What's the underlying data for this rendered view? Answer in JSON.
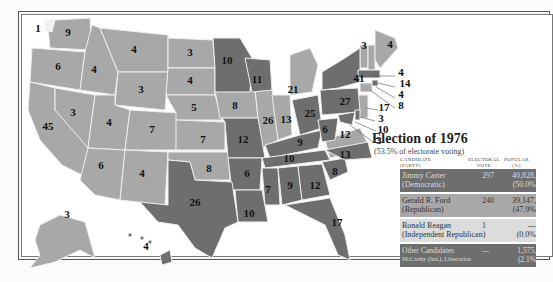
{
  "legend": {
    "title": "Election of 1976",
    "subtitle": "(53.5% of electorate voting)",
    "headers": {
      "candidate": "CANDIDATE",
      "party": "(PARTY)",
      "electoral_1": "ELECTORAL",
      "electoral_2": "VOTE",
      "popular_1": "POPULAR",
      "popular_2": "(%)"
    },
    "rows": [
      {
        "name": "Jimmy Carter",
        "party": "(Democratic)",
        "electoral": "297",
        "popular": "40,828,",
        "pct": "(50.0%"
      },
      {
        "name": "Gerald R. Ford",
        "party": "(Republican)",
        "electoral": "240",
        "popular": "39,147,",
        "pct": "(47.9%"
      },
      {
        "name": "Ronald Reagan",
        "party": "(Independent Republican)",
        "electoral": "1",
        "popular": "—",
        "pct": "(0.0%"
      },
      {
        "name": "Other Candidates",
        "party": "McCarthy (Ind.), Libertarian",
        "electoral": "—",
        "popular": "1,575,",
        "pct": "(2.1%"
      }
    ]
  },
  "colors": {
    "democratic": "#6e6e6e",
    "republican": "#a8a8a8",
    "independent": "#dcdcdc"
  },
  "states": {
    "WA_reagan": "1",
    "WA": "9",
    "OR": "6",
    "CA": "45",
    "ID": "4",
    "MT": "4",
    "NV": "3",
    "WY": "3",
    "UT": "4",
    "AZ": "6",
    "CO": "7",
    "NM": "4",
    "ND": "3",
    "SD": "4",
    "NE": "5",
    "KS": "7",
    "OK": "8",
    "TX": "26",
    "MN": "10",
    "IA": "8",
    "MO": "12",
    "AR": "6",
    "LA": "10",
    "WI": "11",
    "IL": "26",
    "MI": "21",
    "IN": "13",
    "OH": "25",
    "KY": "9",
    "TN": "10",
    "MS": "7",
    "AL": "9",
    "GA": "12",
    "FL": "17",
    "SC": "8",
    "NC": "13",
    "VA": "12",
    "WV": "6",
    "PA": "27",
    "NY": "41",
    "VT": "3",
    "ME": "4",
    "NH": "4",
    "MA": "14",
    "RI": "4",
    "CT": "8",
    "NJ": "17",
    "DE": "3",
    "MD": "10",
    "DC": "3",
    "AK": "3",
    "HI": "4"
  }
}
